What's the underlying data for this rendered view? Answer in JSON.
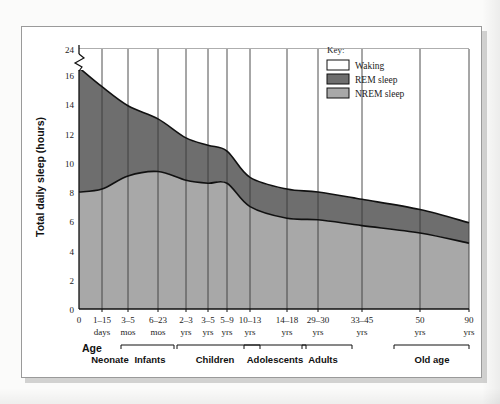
{
  "figure": {
    "title": "",
    "y_axis_title": "Total daily sleep (hours)",
    "x_axis_title": "Age"
  },
  "key": {
    "title": "Key:",
    "items": [
      {
        "label": "Waking",
        "color": "#ffffff"
      },
      {
        "label": "REM sleep",
        "color": "#6e6e6e"
      },
      {
        "label": "NREM sleep",
        "color": "#a8a8a8"
      }
    ]
  },
  "chart_data": {
    "type": "area",
    "title": "",
    "xlabel": "Age",
    "ylabel": "Total daily sleep (hours)",
    "ylim": [
      0,
      24
    ],
    "y_axis_break": {
      "between": [
        16,
        24
      ],
      "label": "axis-break"
    },
    "yticks": [
      "0",
      "2",
      "4",
      "6",
      "8",
      "10",
      "12",
      "14",
      "16",
      "24"
    ],
    "grid": true,
    "legend_position": "top-right",
    "stacked": true,
    "x_tick_labels": [
      {
        "top": "0",
        "bottom": ""
      },
      {
        "top": "1–15",
        "bottom": "days"
      },
      {
        "top": "3–5",
        "bottom": "mos"
      },
      {
        "top": "6–23",
        "bottom": "mos"
      },
      {
        "top": "2–3",
        "bottom": "yrs"
      },
      {
        "top": "3–5",
        "bottom": "yrs"
      },
      {
        "top": "5–9",
        "bottom": "yrs"
      },
      {
        "top": "10–13",
        "bottom": "yrs"
      },
      {
        "top": "14–18",
        "bottom": "yrs"
      },
      {
        "top": "29–30",
        "bottom": "yrs"
      },
      {
        "top": "33–45",
        "bottom": "yrs"
      },
      {
        "top": "50",
        "bottom": "yrs"
      },
      {
        "top": "90",
        "bottom": "yrs"
      }
    ],
    "age_groups": [
      {
        "label": "Neonate",
        "bracket": false
      },
      {
        "label": "Infants",
        "bracket": true
      },
      {
        "label": "Children",
        "bracket": true
      },
      {
        "label": "Adolescents",
        "bracket": true
      },
      {
        "label": "Adults",
        "bracket": true
      },
      {
        "label": "Old age",
        "bracket": true
      }
    ],
    "series": [
      {
        "name": "NREM sleep",
        "color": "#a8a8a8",
        "note": "lower band, 0 to nrem_top",
        "values": [
          8.0,
          8.2,
          9.1,
          9.4,
          8.8,
          8.6,
          8.6,
          7.0,
          6.2,
          6.1,
          5.7,
          5.2,
          4.5
        ]
      },
      {
        "name": "REM sleep",
        "color": "#6e6e6e",
        "note": "upper band, nrem_top to total_sleep",
        "values": [
          8.5,
          7.0,
          4.8,
          3.6,
          2.9,
          2.6,
          2.2,
          2.0,
          2.0,
          1.9,
          1.8,
          1.6,
          1.4
        ]
      },
      {
        "name": "Waking",
        "color": "#ffffff",
        "note": "remainder of the 24 hour day above total sleep",
        "values": [
          7.5,
          8.8,
          10.1,
          11.0,
          12.3,
          12.8,
          13.2,
          15.0,
          15.8,
          16.0,
          16.5,
          17.2,
          18.1
        ]
      }
    ],
    "total_sleep": [
      16.5,
      15.2,
      13.9,
      13.0,
      11.7,
      11.2,
      10.8,
      9.0,
      8.2,
      8.0,
      7.5,
      6.8,
      5.9
    ],
    "nrem_top": [
      8.0,
      8.2,
      9.1,
      9.4,
      8.8,
      8.6,
      8.6,
      7.0,
      6.2,
      6.1,
      5.7,
      5.2,
      4.5
    ]
  }
}
